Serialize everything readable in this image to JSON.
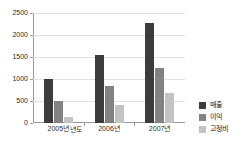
{
  "top_artifact": {
    "text": "· · ·  · ·"
  },
  "chart_data": {
    "type": "bar",
    "title": "",
    "xlabel": "년도",
    "ylabel": "",
    "categories": [
      "2005년",
      "2006년",
      "2007년"
    ],
    "series": [
      {
        "name": "매출",
        "color": "#3c3c3c",
        "values": [
          1000,
          1550,
          2270
        ]
      },
      {
        "name": "이익",
        "color": "#828282",
        "values": [
          500,
          840,
          1250
        ]
      },
      {
        "name": "고정비",
        "color": "#c3c3c3",
        "values": [
          140,
          420,
          680
        ]
      }
    ],
    "ylim": [
      0,
      2500
    ],
    "yticks": [
      0,
      500,
      1000,
      1500,
      2000,
      2500
    ],
    "ytick_labels": [
      "0",
      "500",
      "1000",
      "1500",
      "2000",
      "2500"
    ],
    "grid": true,
    "legend_position": "right"
  }
}
